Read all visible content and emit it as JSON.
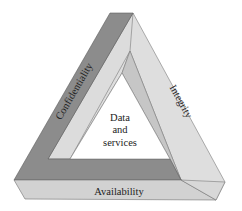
{
  "diagram": {
    "type": "penrose-triangle",
    "center": {
      "line1": "Data",
      "line2": "and",
      "line3": "services"
    },
    "sides": {
      "left": "Confidentiality",
      "right": "Integrity",
      "bottom": "Availability"
    },
    "colors": {
      "dark": "#8c8c8c",
      "mid": "#c6c6c6",
      "light": "#dedede",
      "bottom_face": "#d2d2d2",
      "inner": "#ffffff",
      "edge": "#6e6e6e"
    }
  }
}
